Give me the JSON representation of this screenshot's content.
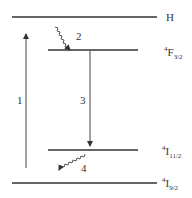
{
  "diagram": {
    "levels": [
      {
        "id": "H",
        "label": "H",
        "sup": "",
        "sub": ""
      },
      {
        "id": "F32",
        "label": "F",
        "sup": "4",
        "sub": "3/2"
      },
      {
        "id": "I112",
        "label": "I",
        "sup": "4",
        "sub": "11/2"
      },
      {
        "id": "I92",
        "label": "I",
        "sup": "4",
        "sub": "9/2"
      }
    ],
    "transitions": [
      {
        "id": "1",
        "label": "1",
        "type": "straight-up",
        "from": "I92",
        "to": "H"
      },
      {
        "id": "2",
        "label": "2",
        "type": "wavy-down",
        "from": "H",
        "to": "F32"
      },
      {
        "id": "3",
        "label": "3",
        "type": "straight-down",
        "from": "F32",
        "to": "I112"
      },
      {
        "id": "4",
        "label": "4",
        "type": "wavy-down",
        "from": "I112",
        "to": "I92"
      }
    ]
  }
}
